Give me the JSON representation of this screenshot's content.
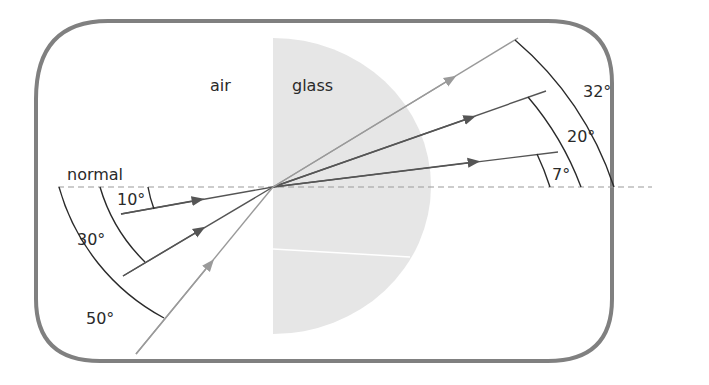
{
  "diagram": {
    "media": {
      "left": "air",
      "right": "glass"
    },
    "normal_label": "normal",
    "incident_angles": [
      {
        "label": "10°",
        "value": 10
      },
      {
        "label": "30°",
        "value": 30
      },
      {
        "label": "50°",
        "value": 50
      }
    ],
    "refracted_angles": [
      {
        "label": "7°",
        "value": 7
      },
      {
        "label": "20°",
        "value": 20
      },
      {
        "label": "32°",
        "value": 32
      }
    ],
    "colors": {
      "frame": "#808080",
      "glass_fill": "#e6e6e6",
      "normal_line": "#9a9a9a",
      "ray_10": "#555555",
      "ray_30": "#555555",
      "ray_50": "#9a9a9a",
      "arc": "#2a2a2a"
    }
  }
}
